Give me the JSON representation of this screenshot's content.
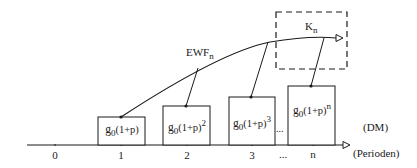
{
  "diagram": {
    "axis": {
      "unit_label": "(Perioden)",
      "value_unit_label": "(DM)",
      "ticks": [
        "0",
        "1",
        "2",
        "3",
        "...",
        "n"
      ]
    },
    "curve_label": {
      "main": "EWF",
      "sub": "n"
    },
    "target_box_label": {
      "main": "K",
      "sub": "n"
    },
    "boxes": [
      {
        "base": "g",
        "base_sub": "0",
        "expr": "(1+p)",
        "exp": ""
      },
      {
        "base": "g",
        "base_sub": "0",
        "expr": "(1+p)",
        "exp": "2"
      },
      {
        "base": "g",
        "base_sub": "0",
        "expr": "(1+p)",
        "exp": "3"
      },
      {
        "base": "g",
        "base_sub": "0",
        "expr": "(1+p)",
        "exp": "n"
      }
    ],
    "between_boxes_ellipsis": "..."
  }
}
